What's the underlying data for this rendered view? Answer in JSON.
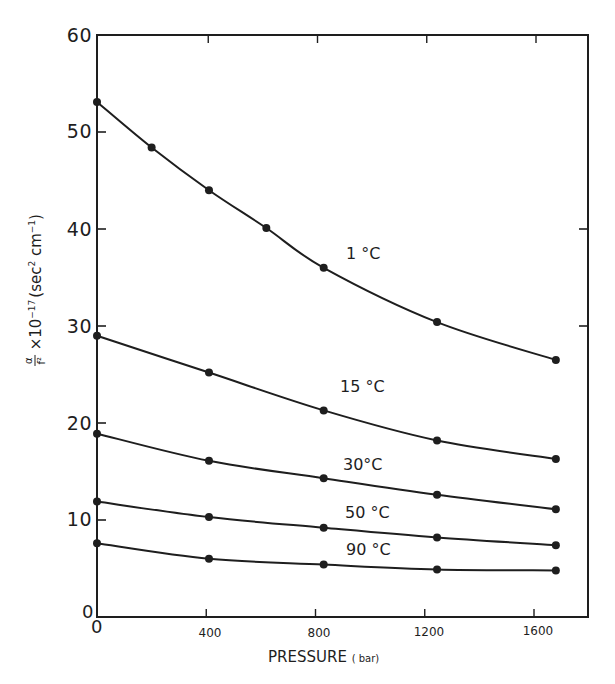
{
  "chart_data": {
    "type": "line",
    "title": "",
    "xlabel": "PRESSURE",
    "xlabel_unit": "( bar)",
    "ylabel": "α/f² × 10⁻¹⁷ (sec² cm⁻¹)",
    "ylabel_parts": {
      "num": "α",
      "den": "f²",
      "mult": "×10",
      "exp": "−17",
      "unit_open": "(sec",
      "unit_exp1": "2",
      "unit_mid": " cm",
      "unit_exp2": "−1",
      "unit_close": ")"
    },
    "xlim": [
      0,
      1800
    ],
    "ylim": [
      0,
      60
    ],
    "xticks": [
      0,
      400,
      800,
      1200,
      1600
    ],
    "xtick_labels": [
      "0",
      "400",
      "800",
      "1200",
      "1600"
    ],
    "yticks": [
      0,
      10,
      20,
      30,
      40,
      50,
      60
    ],
    "ytick_labels": [
      "0",
      "10",
      "20",
      "30",
      "40",
      "50",
      "60"
    ],
    "grid": false,
    "legend": "inline labels",
    "series": [
      {
        "name": "1 °C",
        "x": [
          0,
          200,
          410,
          620,
          830,
          1245,
          1680
        ],
        "values": [
          53.1,
          48.4,
          44.0,
          40.1,
          36.0,
          30.4,
          26.5
        ]
      },
      {
        "name": "15 °C",
        "x": [
          0,
          410,
          830,
          1245,
          1680
        ],
        "values": [
          29.0,
          25.2,
          21.3,
          18.2,
          16.3
        ]
      },
      {
        "name": "30°C",
        "x": [
          0,
          410,
          830,
          1245,
          1680
        ],
        "values": [
          18.9,
          16.1,
          14.3,
          12.6,
          11.1
        ]
      },
      {
        "name": "50 °C",
        "x": [
          0,
          410,
          830,
          1245,
          1680
        ],
        "values": [
          11.9,
          10.3,
          9.2,
          8.2,
          7.4
        ]
      },
      {
        "name": "90 °C",
        "x": [
          0,
          410,
          830,
          1245,
          1680
        ],
        "values": [
          7.6,
          6.0,
          5.4,
          4.9,
          4.8
        ]
      }
    ],
    "annotations": [
      {
        "text": "1 °C",
        "x": 1000,
        "y": 38.0
      },
      {
        "text": "15 °C",
        "x": 1000,
        "y": 24.0
      },
      {
        "text": "30°C",
        "x": 1000,
        "y": 15.7
      },
      {
        "text": "50 °C",
        "x": 1000,
        "y": 10.9
      },
      {
        "text": "90 °C",
        "x": 1000,
        "y": 7.0
      }
    ]
  },
  "labels": {
    "series_1": "1 °C",
    "series_2": "15 °C",
    "series_3": "30°C",
    "series_4": "50 °C",
    "series_5": "90 °C",
    "x_title": "PRESSURE",
    "x_unit": "( bar)",
    "y_zero": "0",
    "x_zero": "0",
    "xticks": [
      "400",
      "800",
      "1200",
      "1600"
    ],
    "yticks": [
      "10",
      "20",
      "30",
      "40",
      "50",
      "60"
    ],
    "y_frac_num": "α",
    "y_frac_den": "f²",
    "y_mult": "×10",
    "y_exp": "−17",
    "y_unit_a": "(sec",
    "y_unit_a_exp": "2",
    "y_unit_b": " cm",
    "y_unit_b_exp": "−1",
    "y_unit_close": ")"
  },
  "colors": {
    "ink": "#1e1e1e",
    "background": "#ffffff"
  }
}
